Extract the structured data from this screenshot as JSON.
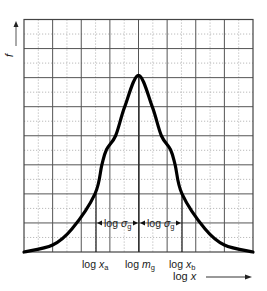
{
  "chart_data": {
    "type": "line",
    "title": "",
    "xlabel": "log x",
    "ylabel": "f",
    "grid": {
      "major_columns": 8,
      "major_rows": 8,
      "minor_dotted": true
    },
    "legend": null,
    "series": [
      {
        "name": "log-normal frequency distribution (bell curve on log x axis)",
        "x_norm": [
          0.0,
          0.125,
          0.21,
          0.31,
          0.34,
          0.36,
          0.4,
          0.44,
          0.5,
          0.56,
          0.6,
          0.64,
          0.66,
          0.69,
          0.79,
          0.875,
          1.0
        ],
        "y_norm": [
          0.0,
          0.03,
          0.1,
          0.25,
          0.375,
          0.44,
          0.5,
          0.625,
          0.76,
          0.625,
          0.5,
          0.44,
          0.375,
          0.25,
          0.1,
          0.03,
          0.0
        ]
      }
    ],
    "annotations": [
      {
        "text": "log x_a",
        "x_norm": 0.31
      },
      {
        "text": "log m_g",
        "x_norm": 0.5
      },
      {
        "text": "log x_b",
        "x_norm": 0.69
      },
      {
        "text": "log σ_g",
        "from": "log x_a",
        "to": "log m_g"
      },
      {
        "text": "log σ_g",
        "from": "log m_g",
        "to": "log x_b"
      }
    ]
  },
  "labels": {
    "y_axis": "f",
    "x_axis_prefix": "log ",
    "x_axis_var": "x",
    "log_word": "log ",
    "xa_var": "x",
    "xa_sub": "a",
    "mg_var": "m",
    "mg_sub": "g",
    "xb_var": "x",
    "xb_sub": "b",
    "sigma_var": "σ",
    "sigma_sub": "g"
  },
  "colors": {
    "curve": "#000000",
    "grid_major": "#555555",
    "grid_minor": "#aaaaaa"
  }
}
